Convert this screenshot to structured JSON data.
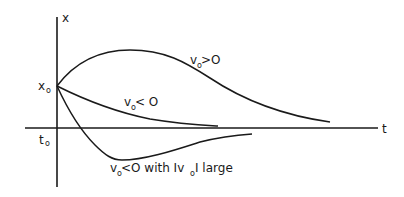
{
  "diagram": {
    "axes": {
      "vertical_label": "x",
      "horizontal_label": "t",
      "initial_position_label": "x",
      "initial_position_subscript": "o",
      "initial_time_label": "t",
      "initial_time_subscript": "o"
    },
    "curves": [
      {
        "id": "positive-velocity",
        "label_main": "v",
        "label_sub": "o",
        "label_rest": " >O"
      },
      {
        "id": "negative-velocity",
        "label_main": "v",
        "label_sub": "o",
        "label_rest": "< O"
      },
      {
        "id": "negative-large-velocity",
        "label_main": "v",
        "label_sub": "o",
        "label_rest": "<O with Iv",
        "label_sub2": "o",
        "label_rest2": "I large"
      }
    ],
    "colors": {
      "ink": "#1a1a1a",
      "background": "#ffffff"
    }
  }
}
